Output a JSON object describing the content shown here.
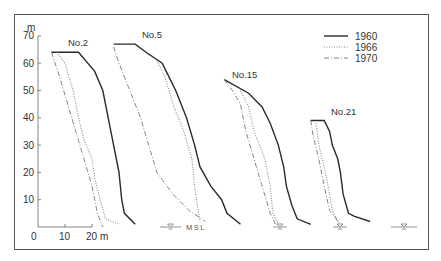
{
  "chart_data": {
    "type": "line",
    "title": "",
    "xlabel": "m",
    "ylabel": "m",
    "y_ticks": [
      0,
      10,
      20,
      30,
      40,
      50,
      60,
      70
    ],
    "y_tick_labels": [
      "10",
      "20",
      "30",
      "40",
      "50",
      "60",
      "70"
    ],
    "x_ticks": [
      0,
      10,
      20
    ],
    "x_tick_labels": [
      "0",
      "10",
      "20 m"
    ],
    "ylim": [
      0,
      70
    ],
    "grid": false,
    "legend_position": "top-right",
    "legend": [
      {
        "name": "1960",
        "style": "solid"
      },
      {
        "name": "1966",
        "style": "dotted"
      },
      {
        "name": "1970",
        "style": "dash-dot"
      }
    ],
    "annotations": [
      "MSL"
    ],
    "profiles": [
      {
        "name": "No.2",
        "series": [
          {
            "name": "1960",
            "points": [
              [
                5,
                64
              ],
              [
                15,
                64
              ],
              [
                21,
                57
              ],
              [
                24,
                50
              ],
              [
                26,
                40
              ],
              [
                28,
                30
              ],
              [
                30,
                20
              ],
              [
                31,
                10
              ],
              [
                32,
                5
              ],
              [
                36,
                1
              ]
            ]
          },
          {
            "name": "1966",
            "points": [
              [
                7,
                64
              ],
              [
                10,
                60
              ],
              [
                13,
                50
              ],
              [
                15,
                40
              ],
              [
                17,
                32
              ],
              [
                20,
                25
              ],
              [
                21,
                18
              ],
              [
                23,
                10
              ],
              [
                25,
                3
              ],
              [
                30,
                1
              ]
            ]
          },
          {
            "name": "1970",
            "points": [
              [
                5,
                64
              ],
              [
                8,
                55
              ],
              [
                11,
                45
              ],
              [
                14,
                35
              ],
              [
                17,
                25
              ],
              [
                20,
                15
              ],
              [
                22,
                5
              ],
              [
                24,
                0
              ]
            ]
          }
        ]
      },
      {
        "name": "No.5",
        "series": [
          {
            "name": "1960",
            "points": [
              [
                28,
                67
              ],
              [
                36,
                67
              ],
              [
                40,
                64
              ],
              [
                46,
                60
              ],
              [
                48,
                56
              ],
              [
                51,
                50
              ],
              [
                55,
                40
              ],
              [
                58,
                30
              ],
              [
                60,
                22
              ],
              [
                64,
                15
              ],
              [
                68,
                10
              ],
              [
                70,
                5
              ],
              [
                75,
                1
              ]
            ]
          },
          {
            "name": "1966",
            "points": [
              [
                44,
                61
              ],
              [
                47,
                55
              ],
              [
                50,
                45
              ],
              [
                54,
                35
              ],
              [
                57,
                25
              ],
              [
                58,
                15
              ],
              [
                59,
                8
              ],
              [
                60,
                2
              ]
            ]
          },
          {
            "name": "1970",
            "points": [
              [
                28,
                66
              ],
              [
                30,
                60
              ],
              [
                34,
                50
              ],
              [
                38,
                40
              ],
              [
                41,
                30
              ],
              [
                44,
                20
              ],
              [
                50,
                12
              ],
              [
                56,
                6
              ],
              [
                62,
                2
              ]
            ]
          }
        ]
      },
      {
        "name": "No.15",
        "series": [
          {
            "name": "1960",
            "points": [
              [
                69,
                54
              ],
              [
                78,
                49
              ],
              [
                83,
                44
              ],
              [
                86,
                38
              ],
              [
                89,
                30
              ],
              [
                91,
                22
              ],
              [
                92,
                15
              ],
              [
                94,
                8
              ],
              [
                96,
                3
              ],
              [
                101,
                1
              ]
            ]
          },
          {
            "name": "1966",
            "points": [
              [
                75,
                50
              ],
              [
                78,
                44
              ],
              [
                80,
                35
              ],
              [
                84,
                25
              ],
              [
                86,
                15
              ],
              [
                87,
                5
              ],
              [
                89,
                1
              ]
            ]
          },
          {
            "name": "1970",
            "points": [
              [
                69,
                54
              ],
              [
                72,
                50
              ],
              [
                75,
                45
              ],
              [
                77,
                35
              ],
              [
                80,
                25
              ],
              [
                83,
                15
              ],
              [
                86,
                5
              ],
              [
                88,
                1
              ]
            ]
          }
        ]
      },
      {
        "name": "No.21",
        "series": [
          {
            "name": "1960",
            "points": [
              [
                101,
                39
              ],
              [
                106,
                39
              ],
              [
                108,
                35
              ],
              [
                109,
                30
              ],
              [
                111,
                25
              ],
              [
                112,
                20
              ],
              [
                113,
                12
              ],
              [
                115,
                5
              ],
              [
                117,
                4
              ],
              [
                123,
                2
              ]
            ]
          },
          {
            "name": "1966",
            "points": [
              [
                103,
                38
              ],
              [
                104,
                30
              ],
              [
                106,
                22
              ],
              [
                108,
                12
              ],
              [
                109,
                6
              ],
              [
                111,
                2
              ]
            ]
          },
          {
            "name": "1970",
            "points": [
              [
                101,
                39
              ],
              [
                102,
                33
              ],
              [
                104,
                25
              ],
              [
                106,
                15
              ],
              [
                108,
                6
              ],
              [
                112,
                1
              ]
            ]
          }
        ]
      }
    ]
  },
  "labels": {
    "y_unit": "m",
    "x_unit": "m",
    "msl": "MSL",
    "profiles": [
      "No.2",
      "No.5",
      "No.15",
      "No.21"
    ],
    "legend": [
      "1960",
      "1966",
      "1970"
    ]
  }
}
